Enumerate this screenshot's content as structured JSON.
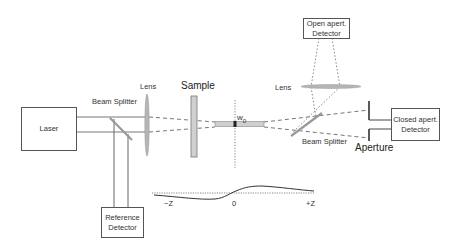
{
  "diagram": {
    "components": {
      "laser": {
        "label": "Laser"
      },
      "beam_splitter_left": {
        "label": "Beam Splitter"
      },
      "lens_left": {
        "label": "Lens"
      },
      "sample": {
        "label": "Sample"
      },
      "focus": {
        "label_main": "w",
        "label_sub": "0"
      },
      "lens_right": {
        "label": "Lens"
      },
      "open_detector": {
        "line1": "Open apert.",
        "line2": "Detector"
      },
      "beam_splitter_right": {
        "label": "Beam Splitter"
      },
      "aperture": {
        "label": "Aperture"
      },
      "closed_detector": {
        "line1": "Closed apert.",
        "line2": "Detector"
      },
      "reference_detector": {
        "line1": "Reference",
        "line2": "Detector"
      }
    },
    "zscan_curve": {
      "axis_labels": {
        "left": "−Z",
        "center": "0",
        "right": "+Z"
      },
      "description": "Closed-aperture transmittance: valley before focus (−Z), peak after focus (+Z)"
    },
    "colors": {
      "line": "#555555",
      "optic_fill": "#b8b8b8",
      "sample_fill": "#cfcfcf",
      "dashed_beam": "#666666"
    }
  }
}
